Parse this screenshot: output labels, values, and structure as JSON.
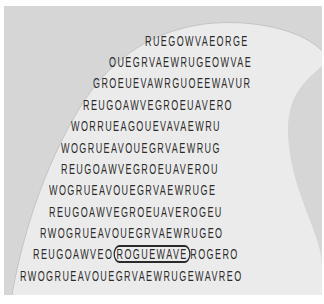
{
  "puzzle": {
    "type": "word-search",
    "shape": "wave",
    "found_word": "ROGUEWAVE",
    "colors": {
      "background": "#d6d6d6",
      "wave": "#ebebeb",
      "text": "#2b2b2b",
      "circle": "#2a2a2a"
    },
    "rows": [
      {
        "pre": "RUEGOWVAEORGE"
      },
      {
        "pre": "OUEGRVAEWRUGEOWVAE"
      },
      {
        "pre": "GROEUEVAWRGUOEEWAVUR"
      },
      {
        "pre": "REUGOAWVEGROEUAVERO"
      },
      {
        "pre": "WORRUEAGOUEVAVAEWRU"
      },
      {
        "pre": "WOGRUEAVOUEGRVAEWRUG"
      },
      {
        "pre": "REUGOAWVEGROEUAVEROU"
      },
      {
        "pre": "WOGRUEAVOUEGRVAEWRUGE"
      },
      {
        "pre": "REUGOAWVEGROEUAVEROGEU"
      },
      {
        "pre": "RWOGRUEAVOUEGRVAEWRUGEO"
      },
      {
        "pre": "REUGOAWVEO",
        "circled": "ROGUEWAVE",
        "post": "ROGERO"
      },
      {
        "pre": "RWOGRUEAVOUEGRVAEWRUGEWAVREO"
      }
    ]
  }
}
